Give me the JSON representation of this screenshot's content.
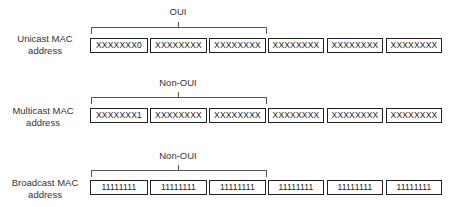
{
  "rows": [
    {
      "label_line1": "Unicast MAC",
      "label_line2": "address",
      "bracket_label": "OUI",
      "octets": [
        "XXXXXXX0",
        "XXXXXXXX",
        "XXXXXXXX",
        "XXXXXXXX",
        "XXXXXXXX",
        "XXXXXXXX"
      ]
    },
    {
      "label_line1": "Multicast MAC",
      "label_line2": "address",
      "bracket_label": "Non-OUI",
      "octets": [
        "XXXXXXX1",
        "XXXXXXXX",
        "XXXXXXXX",
        "XXXXXXXX",
        "XXXXXXXX",
        "XXXXXXXX"
      ]
    },
    {
      "label_line1": "Broadcast MAC",
      "label_line2": "address",
      "bracket_label": "Non-OUI",
      "octets": [
        "11111111",
        "11111111",
        "11111111",
        "11111111",
        "11111111",
        "11111111"
      ]
    }
  ]
}
